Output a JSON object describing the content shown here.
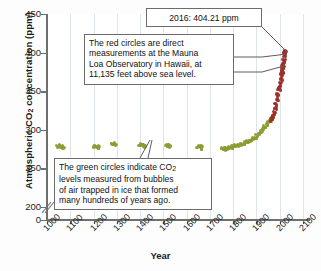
{
  "chart_data": {
    "type": "scatter",
    "title": "",
    "xlabel": "Year",
    "ylabel": "Atmospheric CO2 concentration (ppm)",
    "ylabel_parts": {
      "pre": "Atmospheric CO",
      "sub": "2",
      "post": " concentration (ppm)"
    },
    "xlim": [
      1000,
      2100
    ],
    "ylim": [
      200,
      450
    ],
    "y_axis_break": true,
    "y_break_between": [
      0,
      200
    ],
    "xticks": [
      1000,
      1100,
      1200,
      1300,
      1400,
      1500,
      1600,
      1700,
      1800,
      1900,
      2000,
      2100
    ],
    "yticks": [
      0,
      200,
      250,
      300,
      350,
      400,
      450
    ],
    "grid": "vertical",
    "legend": "none",
    "series": [
      {
        "name": "Ice core bubble measurements",
        "color": "#8d9c33",
        "marker": "circle",
        "points": [
          [
            1040,
            280
          ],
          [
            1048,
            281
          ],
          [
            1056,
            280
          ],
          [
            1062,
            279
          ],
          [
            1195,
            280
          ],
          [
            1203,
            281
          ],
          [
            1210,
            279
          ],
          [
            1218,
            280
          ],
          [
            1272,
            283
          ],
          [
            1280,
            284
          ],
          [
            1288,
            283
          ],
          [
            1392,
            282
          ],
          [
            1400,
            283
          ],
          [
            1407,
            282
          ],
          [
            1414,
            281
          ],
          [
            1505,
            281
          ],
          [
            1513,
            282
          ],
          [
            1520,
            281
          ],
          [
            1640,
            279
          ],
          [
            1648,
            281
          ],
          [
            1654,
            278
          ],
          [
            1660,
            280
          ],
          [
            1745,
            277
          ],
          [
            1755,
            278
          ],
          [
            1762,
            277
          ],
          [
            1770,
            278
          ],
          [
            1778,
            279
          ],
          [
            1786,
            279
          ],
          [
            1793,
            280
          ],
          [
            1800,
            281
          ],
          [
            1808,
            281
          ],
          [
            1815,
            282
          ],
          [
            1822,
            283
          ],
          [
            1830,
            283
          ],
          [
            1838,
            284
          ],
          [
            1845,
            285
          ],
          [
            1852,
            286
          ],
          [
            1860,
            287
          ],
          [
            1867,
            288
          ],
          [
            1874,
            289
          ],
          [
            1881,
            291
          ],
          [
            1888,
            292
          ],
          [
            1895,
            294
          ],
          [
            1902,
            296
          ],
          [
            1909,
            298
          ],
          [
            1916,
            300
          ],
          [
            1923,
            303
          ],
          [
            1930,
            306
          ],
          [
            1937,
            309
          ],
          [
            1944,
            311
          ],
          [
            1951,
            313
          ],
          [
            1958,
            316
          ],
          [
            1963,
            318
          ],
          [
            1968,
            321
          ]
        ]
      },
      {
        "name": "Mauna Loa direct measurements",
        "color": "#9e2f28",
        "marker": "circle",
        "points": [
          [
            1958,
            315
          ],
          [
            1962,
            318
          ],
          [
            1966,
            321
          ],
          [
            1970,
            325
          ],
          [
            1974,
            330
          ],
          [
            1978,
            335
          ],
          [
            1982,
            341
          ],
          [
            1986,
            347
          ],
          [
            1990,
            354
          ],
          [
            1993,
            358
          ],
          [
            1996,
            363
          ],
          [
            1999,
            368
          ],
          [
            2002,
            373
          ],
          [
            2004,
            377
          ],
          [
            2006,
            381
          ],
          [
            2008,
            385
          ],
          [
            2010,
            389
          ],
          [
            2012,
            393
          ],
          [
            2014,
            398
          ],
          [
            2015,
            401
          ],
          [
            2016,
            404.21
          ]
        ]
      }
    ],
    "annotations": [
      {
        "id": "peak-value",
        "text": "2016: 404.21 ppm",
        "points_to": [
          2016,
          404.21
        ]
      },
      {
        "id": "red-circles-note",
        "text": "The red circles are direct measurements at the Mauna Loa Observatory in Hawaii, at 11,135 feet above sea level.",
        "lines": [
          "The red circles are direct",
          "measurements at the Mauna",
          "Loa Observatory in Hawaii, at",
          "11,135 feet above sea level."
        ]
      },
      {
        "id": "green-circles-note",
        "text": "The green circles indicate CO2 levels measured from bubbles of air trapped in ice that formed many hundreds of years ago.",
        "lines": [
          {
            "pre": "The green circles indicate CO",
            "sub": "2",
            "post": ""
          },
          {
            "pre": "levels measured from bubbles",
            "sub": "",
            "post": ""
          },
          {
            "pre": "of air trapped in ice that formed",
            "sub": "",
            "post": ""
          },
          {
            "pre": "many hundreds of years ago.",
            "sub": "",
            "post": ""
          }
        ]
      }
    ]
  }
}
